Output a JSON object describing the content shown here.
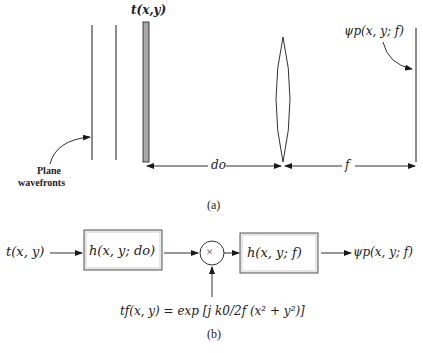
{
  "figure": {
    "part_a": {
      "caption": "(a)",
      "input_label": "t(x,y)",
      "output_label": "ψp(x, y; f)",
      "wavefront_label_line1": "Plane",
      "wavefront_label_line2": "wavefronts",
      "distance_object_label": "do",
      "distance_focal_label": "f"
    },
    "part_b": {
      "caption": "(b)",
      "input": "t(x, y)",
      "block1": "h(x, y; do)",
      "multiplier_symbol": "×",
      "block2": "h(x, y; f)",
      "output": "ψp(x, y; f)",
      "lens_function": "tf(x, y)  = exp [j k0/2f (x² + y²)]"
    },
    "colors": {
      "line": "#1a1a1a",
      "plate_fill": "#a8a8a8",
      "box_fill": "#e6e6e6",
      "box_border": "#555555"
    }
  }
}
